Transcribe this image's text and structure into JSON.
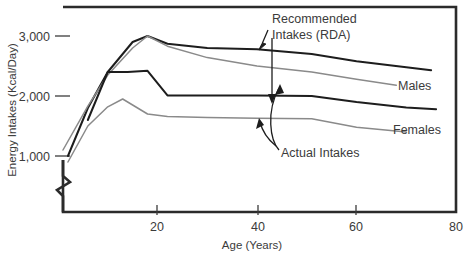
{
  "chart_data": {
    "type": "line",
    "title": "",
    "xlabel": "Age (Years)",
    "ylabel": "Energy Intakes (Kcal/Day)",
    "xlim": [
      0,
      80
    ],
    "ylim": [
      800,
      3400
    ],
    "grid": false,
    "legend_position": "inline-right",
    "axis_break": "y-axis broken below 1,000",
    "xticks": [
      20,
      40,
      60,
      80
    ],
    "xticklabels": [
      "20",
      "40",
      "60",
      "80"
    ],
    "yticks": [
      1000,
      2000,
      3000
    ],
    "yticklabels": [
      "1,000",
      "2,000",
      "3,000"
    ],
    "series": [
      {
        "name": "Recommended Intakes (RDA) - Males",
        "color": "#1d1d1d",
        "x": [
          2,
          6,
          10,
          15,
          18,
          22,
          30,
          40,
          51,
          60,
          70,
          75
        ],
        "y": [
          1000,
          1800,
          2400,
          2900,
          3000,
          2870,
          2800,
          2780,
          2700,
          2580,
          2480,
          2430
        ]
      },
      {
        "name": "Recommended Intakes (RDA) - Females",
        "color": "#8a8a8a",
        "x": [
          1,
          6,
          10,
          15,
          18,
          22,
          30,
          40,
          51,
          60,
          68
        ],
        "y": [
          1100,
          1830,
          2350,
          2800,
          3000,
          2830,
          2640,
          2500,
          2400,
          2280,
          2180
        ]
      },
      {
        "name": "Actual Intakes - Males",
        "color": "#1d1d1d",
        "x": [
          6,
          10,
          14,
          18,
          22,
          30,
          40,
          51,
          60,
          70,
          76
        ],
        "y": [
          1600,
          2400,
          2400,
          2420,
          2010,
          2010,
          2010,
          2000,
          1900,
          1810,
          1780
        ]
      },
      {
        "name": "Actual Intakes - Females",
        "color": "#8a8a8a",
        "x": [
          2,
          6,
          10,
          13,
          18,
          22,
          30,
          40,
          51,
          60,
          70
        ],
        "y": [
          900,
          1500,
          1820,
          1950,
          1700,
          1660,
          1640,
          1630,
          1620,
          1480,
          1400
        ]
      }
    ],
    "annotations": [
      {
        "id": "rda-annotation",
        "text_lines": [
          "Recommended",
          "Intakes (RDA)"
        ],
        "text": "Recommended Intakes (RDA)",
        "arrow": "double-headed-vertical"
      },
      {
        "id": "actual-annotation",
        "text_lines": [
          "Actual Intakes"
        ],
        "text": "Actual Intakes",
        "arrow": "curved-double-headed"
      },
      {
        "id": "males-label",
        "text": "Males"
      },
      {
        "id": "females-label",
        "text": "Females"
      }
    ]
  },
  "axes": {
    "ylabel": "Energy Intakes (Kcal/Day)",
    "xlabel": "Age (Years)",
    "ytick_3000": "3,000",
    "ytick_2000": "2,000",
    "ytick_1000": "1,000",
    "xtick_20": "20",
    "xtick_40": "40",
    "xtick_60": "60",
    "xtick_80": "80"
  },
  "annotations": {
    "rda_line1": "Recommended",
    "rda_line2": "Intakes (RDA)",
    "actual": "Actual Intakes",
    "males": "Males",
    "females": "Females"
  },
  "colors": {
    "frame": "#2b2b2b",
    "dark_series": "#1d1d1d",
    "light_series": "#8a8a8a",
    "text": "#3b3b3b",
    "background": "#ffffff"
  }
}
